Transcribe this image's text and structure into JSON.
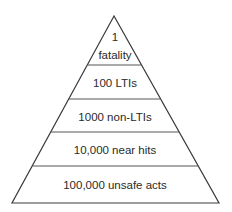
{
  "diagram": {
    "type": "pyramid",
    "levels": [
      {
        "line1": "1",
        "line2": "fatality"
      },
      {
        "label": "100 LTIs"
      },
      {
        "label": "1000 non-LTIs"
      },
      {
        "label": "10,000 near hits"
      },
      {
        "label": "100,000 unsafe acts"
      }
    ],
    "stroke_color": "#3a3a3a",
    "text_color": "#2a2a2a"
  }
}
